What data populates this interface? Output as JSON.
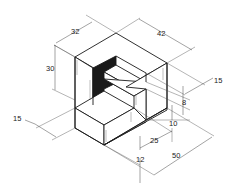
{
  "drawing": {
    "type": "isometric-dimensioned-block",
    "colors": {
      "line": "#1a1a1a",
      "shadow": "#1a1a1a",
      "face": "#ffffff",
      "background": "#ffffff"
    },
    "dimensions": [
      {
        "id": "d32",
        "label": "32",
        "x": 58,
        "y": 34
      },
      {
        "id": "d42",
        "label": "42",
        "x": 158,
        "y": 36
      },
      {
        "id": "d30",
        "label": "30",
        "x": 51,
        "y": 71
      },
      {
        "id": "d15r",
        "label": "15",
        "x": 218,
        "y": 83
      },
      {
        "id": "d8",
        "label": "8",
        "x": 184,
        "y": 106
      },
      {
        "id": "d10",
        "label": "10",
        "x": 169,
        "y": 126
      },
      {
        "id": "d15l",
        "label": "15",
        "x": 12,
        "y": 121
      },
      {
        "id": "d25",
        "label": "25",
        "x": 154,
        "y": 143
      },
      {
        "id": "d12",
        "label": "12",
        "x": 137,
        "y": 162
      },
      {
        "id": "d50",
        "label": "50",
        "x": 175,
        "y": 158
      }
    ]
  }
}
